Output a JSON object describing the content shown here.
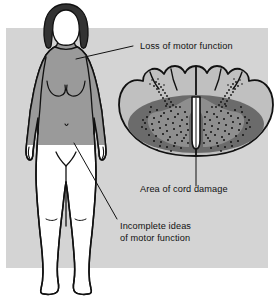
{
  "figure": {
    "background_color": "#ffffff",
    "panel_color": "#d4d4d4"
  },
  "labels": [
    {
      "id": "loss-of-motor-function",
      "text": "Loss of motor function",
      "x": 140,
      "y": 49,
      "anchor": "start",
      "leader": {
        "x1": 133,
        "y1": 46,
        "x2": 76,
        "y2": 59
      }
    },
    {
      "id": "area-of-cord-damage",
      "text": "Area of cord damage",
      "x": 140,
      "y": 192,
      "anchor": "start",
      "leader": {
        "x1": 196,
        "y1": 186,
        "x2": 196,
        "y2": 98
      }
    },
    {
      "id": "incomplete-ideas-of-motor-function",
      "line1": "Incomplete ideas",
      "line2": "of motor function",
      "x": 120,
      "y": 229,
      "anchor": "start",
      "leader": {
        "x1": 117,
        "y1": 219,
        "x2": 74,
        "y2": 143
      }
    }
  ],
  "body_figure": {
    "name": "female-body-anterior-view",
    "shaded_region_label": "upper body affected",
    "shaded_color": "#9a9a9a",
    "unshaded_color": "#ffffff",
    "hair_color": "#333333",
    "outline_color": "#111111",
    "hip_line_y": 145
  },
  "cord_cross_section": {
    "name": "spinal-cord-cross-section",
    "center_x": 196,
    "center_y": 119,
    "white_matter_color": "#c0c0c0",
    "damage_ellipse_color": "#6b6b6b",
    "gray_matter_color": "#8e8e8e",
    "stipple_color": "#111111",
    "central_canal_color": "#ffffff",
    "outline_color": "#111111",
    "dorsal_lobes": 5
  },
  "colors": {
    "panel": "#d4d4d4",
    "body_shaded": "#9a9a9a",
    "hair": "#333333",
    "cord_outer": "#c0c0c0",
    "cord_damage": "#6b6b6b",
    "cord_gray_matter": "#8e8e8e",
    "ink": "#111111",
    "paper": "#ffffff"
  }
}
